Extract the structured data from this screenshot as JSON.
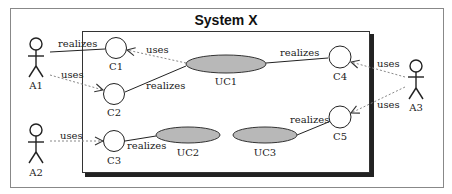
{
  "diagram": {
    "title": "System X",
    "colors": {
      "frame": "#888888",
      "box": "#222222",
      "use_case_fill": "#b8b8b8",
      "component_fill": "#ffffff",
      "dotted": "#888888"
    },
    "actors": [
      {
        "id": "A1",
        "label": "A1"
      },
      {
        "id": "A2",
        "label": "A2"
      },
      {
        "id": "A3",
        "label": "A3"
      }
    ],
    "components": [
      {
        "id": "C1",
        "label": "C1"
      },
      {
        "id": "C2",
        "label": "C2"
      },
      {
        "id": "C3",
        "label": "C3"
      },
      {
        "id": "C4",
        "label": "C4"
      },
      {
        "id": "C5",
        "label": "C5"
      }
    ],
    "use_cases": [
      {
        "id": "UC1",
        "label": "UC1"
      },
      {
        "id": "UC2",
        "label": "UC2"
      },
      {
        "id": "UC3",
        "label": "UC3"
      }
    ],
    "edges": [
      {
        "from": "A1",
        "to": "C1",
        "label": "realizes",
        "style": "solid"
      },
      {
        "from": "A1",
        "to": "C2",
        "label": "uses",
        "style": "dotted-arrow"
      },
      {
        "from": "UC1",
        "to": "C1",
        "label": "uses",
        "style": "dotted-arrow"
      },
      {
        "from": "C2",
        "to": "UC1",
        "label": "realizes",
        "style": "solid"
      },
      {
        "from": "UC1",
        "to": "C4",
        "label": "realizes",
        "style": "solid"
      },
      {
        "from": "A3",
        "to": "C4",
        "label": "uses",
        "style": "dotted-arrow"
      },
      {
        "from": "A3",
        "to": "C5",
        "label": "uses",
        "style": "dotted-arrow"
      },
      {
        "from": "UC3",
        "to": "C5",
        "label": "realizes",
        "style": "solid"
      },
      {
        "from": "A2",
        "to": "C3",
        "label": "uses",
        "style": "dotted-arrow"
      },
      {
        "from": "C3",
        "to": "UC2",
        "label": "realizes",
        "style": "solid"
      }
    ]
  }
}
